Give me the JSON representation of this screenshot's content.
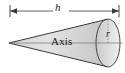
{
  "figure": {
    "name": "cone-geometry-diagram",
    "type": "geometric-solid-diagram",
    "solid": "cone",
    "background_color": "#ffffff",
    "outline_color": "#3a3a3a",
    "fill_color_light": "#e8e8e8",
    "fill_color_dark": "#b9b9b9",
    "dimension_line_color": "#3a3a3a",
    "labels": {
      "height": "h",
      "radius": "r",
      "axis": "Axis"
    },
    "annotations": {
      "height_label": "h",
      "radius_label": "r",
      "axis_label": "Axis"
    },
    "geometry": {
      "apex_x": 9,
      "apex_y": 43,
      "base_center_x": 108,
      "base_center_y": 43,
      "base_rx": 12,
      "base_ry": 24,
      "height_dimension_y": 11,
      "height_dimension_x_start": 10,
      "height_dimension_x_end": 119
    }
  }
}
